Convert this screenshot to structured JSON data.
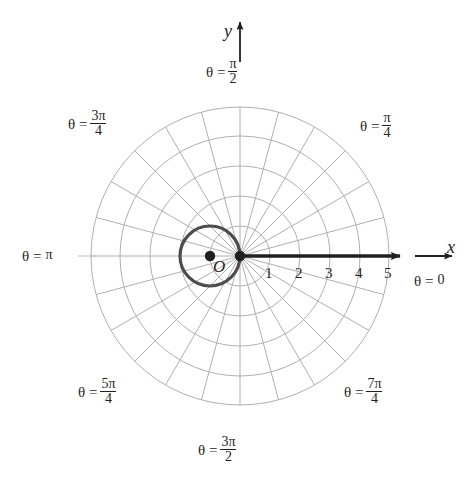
{
  "figure": {
    "type": "polar-grid-plot",
    "background": "#ffffff",
    "ink_color": "#231f20",
    "grid_color": "#b3b3b3",
    "curve_color": "#4d4d4d"
  },
  "axes": {
    "x_letter": "x",
    "y_letter": "y",
    "origin_label": "O",
    "x_ticks": [
      "1",
      "2",
      "3",
      "4",
      "5"
    ]
  },
  "angle_labels": [
    {
      "id": "theta-0",
      "lhs": "θ =",
      "num": "0",
      "den": "",
      "fraction": false,
      "angle_deg": 0
    },
    {
      "id": "theta-pi-4",
      "lhs": "θ =",
      "num": "π",
      "den": "4",
      "fraction": true,
      "angle_deg": 45
    },
    {
      "id": "theta-pi-2",
      "lhs": "θ =",
      "num": "π",
      "den": "2",
      "fraction": true,
      "angle_deg": 90
    },
    {
      "id": "theta-3pi-4",
      "lhs": "θ =",
      "num": "3π",
      "den": "4",
      "fraction": true,
      "angle_deg": 135
    },
    {
      "id": "theta-pi",
      "lhs": "θ =",
      "num": "π",
      "den": "",
      "fraction": false,
      "angle_deg": 180
    },
    {
      "id": "theta-5pi-4",
      "lhs": "θ =",
      "num": "5π",
      "den": "4",
      "fraction": true,
      "angle_deg": 225
    },
    {
      "id": "theta-3pi-2",
      "lhs": "θ =",
      "num": "3π",
      "den": "2",
      "fraction": true,
      "angle_deg": 270
    },
    {
      "id": "theta-7pi-4",
      "lhs": "θ =",
      "num": "7π",
      "den": "4",
      "fraction": true,
      "angle_deg": 315
    }
  ],
  "chart_data": {
    "type": "line",
    "coordinate_system": "polar",
    "title": "",
    "xlabel": "x",
    "ylabel": "y",
    "pole_pixel": {
      "x": 240,
      "y": 256
    },
    "pixels_per_unit": 30,
    "radial_gridlines": [
      1,
      2,
      3,
      4,
      5
    ],
    "radial_tick_labels": [
      "1",
      "2",
      "3",
      "4",
      "5"
    ],
    "angular_gridlines_deg": [
      0,
      15,
      30,
      45,
      60,
      75,
      90,
      105,
      120,
      135,
      150,
      165,
      180,
      195,
      210,
      225,
      240,
      255,
      270,
      285,
      300,
      315,
      330,
      345
    ],
    "angular_tick_labels": [
      "θ = 0",
      "θ = π/4",
      "θ = π/2",
      "θ = 3π/4",
      "θ = π",
      "θ = 5π/4",
      "θ = 3π/2",
      "θ = 7π/4"
    ],
    "rlim": [
      0,
      5
    ],
    "grid": true,
    "legend": false,
    "series": [
      {
        "name": "circle r = -2cos(theta)",
        "equation": "r = -2 cos θ",
        "shape": "circle",
        "center_polar": {
          "r": 1,
          "theta_deg": 180
        },
        "radius": 1,
        "passes_through_pole": true,
        "color": "#4d4d4d"
      }
    ],
    "points": [
      {
        "name": "pole",
        "x": 0,
        "y": 0,
        "marker": "filled-dot"
      },
      {
        "name": "circle-center",
        "x": -1,
        "y": 0,
        "marker": "filled-dot"
      }
    ],
    "annotations": [
      {
        "text": "O",
        "role": "origin-label",
        "x": 0,
        "y": 0
      },
      {
        "text": "x",
        "role": "x-axis-letter"
      },
      {
        "text": "y",
        "role": "y-axis-letter"
      }
    ]
  }
}
